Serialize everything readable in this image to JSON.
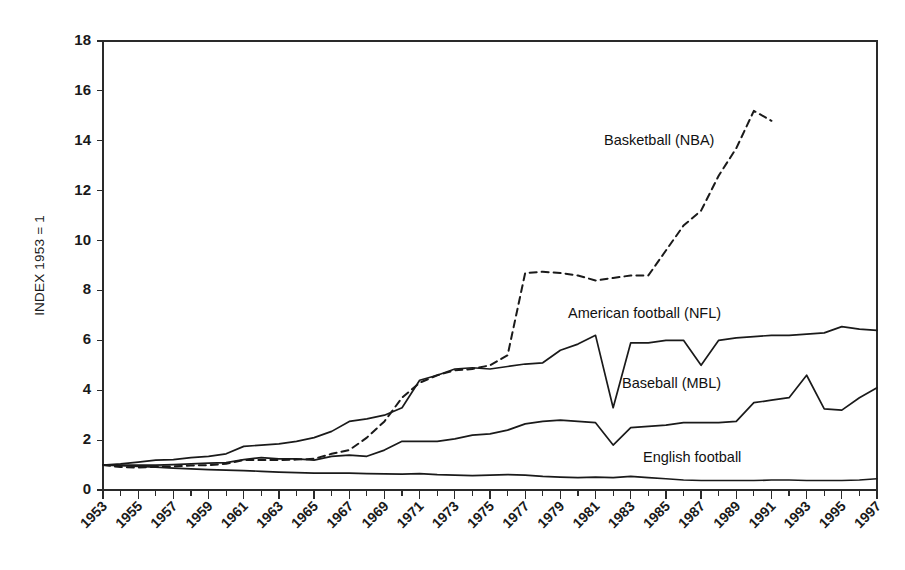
{
  "figure": {
    "background_color": "#ffffff",
    "ink_color": "#1a1a1a"
  },
  "chart_data": {
    "type": "line",
    "title": "",
    "subtitle": "",
    "xlabel": "",
    "ylabel": "INDEX 1953 = 1",
    "xlim": [
      1953,
      1997
    ],
    "ylim": [
      0,
      18
    ],
    "ytick_values": [
      0,
      2,
      4,
      6,
      8,
      10,
      12,
      14,
      16,
      18
    ],
    "ytick_labels": [
      "0",
      "2",
      "4",
      "6",
      "8",
      "10",
      "12",
      "14",
      "16",
      "18"
    ],
    "xtick_labels": [
      "1953",
      "1955",
      "1957",
      "1959",
      "1961",
      "1963",
      "1965",
      "1967",
      "1969",
      "1971",
      "1973",
      "1975",
      "1977",
      "1979",
      "1981",
      "1983",
      "1985",
      "1987",
      "1989",
      "1991",
      "1993",
      "1995",
      "1997"
    ],
    "xtick_label_rotation": 45,
    "x_minor_tick_interval": 1,
    "grid": false,
    "legend_position": "inline-annotations",
    "x": [
      1953,
      1954,
      1955,
      1956,
      1957,
      1958,
      1959,
      1960,
      1961,
      1962,
      1963,
      1964,
      1965,
      1966,
      1967,
      1968,
      1969,
      1970,
      1971,
      1972,
      1973,
      1974,
      1975,
      1976,
      1977,
      1978,
      1979,
      1980,
      1981,
      1982,
      1983,
      1984,
      1985,
      1986,
      1987,
      1988,
      1989,
      1990,
      1991,
      1992,
      1993,
      1994,
      1995,
      1996,
      1997
    ],
    "series": [
      {
        "name": "Basketball (NBA)",
        "style": "dashed",
        "color": "#1a1a1a",
        "annotation_label": "Basketball (NBA)",
        "x": [
          1953,
          1954,
          1955,
          1956,
          1957,
          1958,
          1959,
          1960,
          1961,
          1962,
          1963,
          1964,
          1965,
          1966,
          1967,
          1968,
          1969,
          1970,
          1971,
          1972,
          1973,
          1974,
          1975,
          1976,
          1977,
          1978,
          1979,
          1980,
          1981,
          1982,
          1983,
          1984,
          1985,
          1986,
          1987,
          1988,
          1989,
          1990,
          1991
        ],
        "values": [
          1.0,
          0.92,
          0.9,
          0.93,
          0.95,
          0.98,
          1.0,
          1.05,
          1.2,
          1.2,
          1.2,
          1.22,
          1.25,
          1.45,
          1.6,
          2.1,
          2.75,
          3.7,
          4.3,
          4.6,
          4.8,
          4.85,
          5.0,
          5.4,
          8.7,
          8.75,
          8.7,
          8.6,
          8.4,
          8.5,
          8.6,
          8.6,
          9.6,
          10.6,
          11.2,
          12.6,
          13.7,
          15.2,
          14.8
        ]
      },
      {
        "name": "American football (NFL)",
        "style": "solid",
        "color": "#1a1a1a",
        "annotation_label": "American football (NFL)",
        "x": [
          1953,
          1954,
          1955,
          1956,
          1957,
          1958,
          1959,
          1960,
          1961,
          1962,
          1963,
          1964,
          1965,
          1966,
          1967,
          1968,
          1969,
          1970,
          1971,
          1972,
          1973,
          1974,
          1975,
          1976,
          1977,
          1978,
          1979,
          1980,
          1981,
          1982,
          1983,
          1984,
          1985,
          1986,
          1987,
          1988,
          1989,
          1990,
          1991,
          1992,
          1993,
          1994,
          1995,
          1996,
          1997
        ],
        "values": [
          1.0,
          1.05,
          1.12,
          1.2,
          1.22,
          1.3,
          1.35,
          1.45,
          1.75,
          1.8,
          1.85,
          1.95,
          2.1,
          2.35,
          2.75,
          2.85,
          3.0,
          3.3,
          4.4,
          4.6,
          4.85,
          4.9,
          4.85,
          4.95,
          5.05,
          5.1,
          5.6,
          5.85,
          6.2,
          3.3,
          5.9,
          5.9,
          6.0,
          6.0,
          5.0,
          6.0,
          6.1,
          6.15,
          6.2,
          6.2,
          6.25,
          6.3,
          6.55,
          6.45,
          6.4
        ]
      },
      {
        "name": "Baseball (MBL)",
        "style": "solid",
        "color": "#1a1a1a",
        "annotation_label": "Baseball (MBL)",
        "x": [
          1953,
          1954,
          1955,
          1956,
          1957,
          1958,
          1959,
          1960,
          1961,
          1962,
          1963,
          1964,
          1965,
          1966,
          1967,
          1968,
          1969,
          1970,
          1971,
          1972,
          1973,
          1974,
          1975,
          1976,
          1977,
          1978,
          1979,
          1980,
          1981,
          1982,
          1983,
          1984,
          1985,
          1986,
          1987,
          1988,
          1989,
          1990,
          1991,
          1992,
          1993,
          1994,
          1995,
          1996,
          1997
        ],
        "values": [
          1.0,
          1.0,
          1.0,
          1.0,
          1.02,
          1.05,
          1.08,
          1.1,
          1.22,
          1.3,
          1.25,
          1.25,
          1.2,
          1.35,
          1.4,
          1.35,
          1.6,
          1.95,
          1.95,
          1.95,
          2.05,
          2.2,
          2.25,
          2.4,
          2.65,
          2.75,
          2.8,
          2.75,
          2.7,
          1.8,
          2.5,
          2.55,
          2.6,
          2.7,
          2.7,
          2.7,
          2.75,
          3.5,
          3.6,
          3.7,
          4.6,
          3.25,
          3.2,
          3.7,
          4.1
        ]
      },
      {
        "name": "English football",
        "style": "solid",
        "color": "#1a1a1a",
        "annotation_label": "English football",
        "x": [
          1953,
          1954,
          1955,
          1956,
          1957,
          1958,
          1959,
          1960,
          1961,
          1962,
          1963,
          1964,
          1965,
          1966,
          1967,
          1968,
          1969,
          1970,
          1971,
          1972,
          1973,
          1974,
          1975,
          1976,
          1977,
          1978,
          1979,
          1980,
          1981,
          1982,
          1983,
          1984,
          1985,
          1986,
          1987,
          1988,
          1989,
          1990,
          1991,
          1992,
          1993,
          1994,
          1995,
          1996,
          1997
        ],
        "values": [
          1.0,
          0.98,
          0.95,
          0.92,
          0.88,
          0.85,
          0.82,
          0.8,
          0.78,
          0.75,
          0.72,
          0.7,
          0.68,
          0.68,
          0.68,
          0.66,
          0.65,
          0.64,
          0.66,
          0.62,
          0.6,
          0.58,
          0.6,
          0.62,
          0.6,
          0.55,
          0.52,
          0.5,
          0.52,
          0.5,
          0.55,
          0.5,
          0.45,
          0.4,
          0.38,
          0.38,
          0.38,
          0.38,
          0.4,
          0.4,
          0.38,
          0.38,
          0.38,
          0.4,
          0.45
        ]
      }
    ],
    "annotations": [
      {
        "text": "Basketball (NBA)",
        "x_px": 604,
        "y_px": 145
      },
      {
        "text": "American football (NFL)",
        "x_px": 568,
        "y_px": 318
      },
      {
        "text": "Baseball (MBL)",
        "x_px": 622,
        "y_px": 388
      },
      {
        "text": "English football",
        "x_px": 643,
        "y_px": 462
      }
    ]
  }
}
